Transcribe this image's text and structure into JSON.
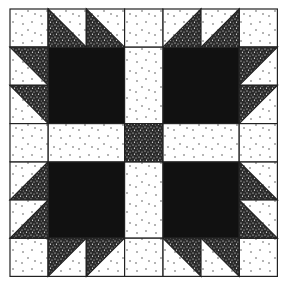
{
  "quilt": {
    "pattern": "Bear's Paw",
    "grid": 7,
    "colors": {
      "background": "#ffffff",
      "light": "#fdfdfd",
      "dark": "#111111",
      "speckle": "#2a2a2a",
      "outline": "#222222"
    },
    "paws": [
      {
        "name": "top-left",
        "pad": {
          "row": 1,
          "col": 1
        },
        "claws": [
          {
            "row": 0,
            "col": 1,
            "dark": "bl"
          },
          {
            "row": 0,
            "col": 2,
            "dark": "bl"
          },
          {
            "row": 1,
            "col": 0,
            "dark": "tr"
          },
          {
            "row": 2,
            "col": 0,
            "dark": "tr"
          }
        ],
        "corner": {
          "row": 0,
          "col": 0
        }
      },
      {
        "name": "top-right",
        "pad": {
          "row": 1,
          "col": 4
        },
        "claws": [
          {
            "row": 0,
            "col": 4,
            "dark": "br"
          },
          {
            "row": 0,
            "col": 5,
            "dark": "br"
          },
          {
            "row": 1,
            "col": 6,
            "dark": "tl"
          },
          {
            "row": 2,
            "col": 6,
            "dark": "tl"
          }
        ],
        "corner": {
          "row": 0,
          "col": 6
        }
      },
      {
        "name": "bottom-left",
        "pad": {
          "row": 4,
          "col": 1
        },
        "claws": [
          {
            "row": 4,
            "col": 0,
            "dark": "br"
          },
          {
            "row": 5,
            "col": 0,
            "dark": "br"
          },
          {
            "row": 6,
            "col": 1,
            "dark": "tl"
          },
          {
            "row": 6,
            "col": 2,
            "dark": "tl"
          }
        ],
        "corner": {
          "row": 6,
          "col": 0
        }
      },
      {
        "name": "bottom-right",
        "pad": {
          "row": 4,
          "col": 4
        },
        "claws": [
          {
            "row": 4,
            "col": 6,
            "dark": "bl"
          },
          {
            "row": 5,
            "col": 6,
            "dark": "bl"
          },
          {
            "row": 6,
            "col": 4,
            "dark": "tr"
          },
          {
            "row": 6,
            "col": 5,
            "dark": "tr"
          }
        ],
        "corner": {
          "row": 6,
          "col": 6
        }
      }
    ],
    "sashing": {
      "center": {
        "row": 3,
        "col": 3
      },
      "cells": [
        {
          "row": 0,
          "col": 3,
          "w": 1,
          "h": 1
        },
        {
          "row": 1,
          "col": 3,
          "w": 1,
          "h": 2
        },
        {
          "row": 4,
          "col": 3,
          "w": 1,
          "h": 2
        },
        {
          "row": 6,
          "col": 3,
          "w": 1,
          "h": 1
        },
        {
          "row": 3,
          "col": 0,
          "w": 1,
          "h": 1
        },
        {
          "row": 3,
          "col": 1,
          "w": 2,
          "h": 1
        },
        {
          "row": 3,
          "col": 4,
          "w": 2,
          "h": 1
        },
        {
          "row": 3,
          "col": 6,
          "w": 1,
          "h": 1
        }
      ]
    }
  }
}
